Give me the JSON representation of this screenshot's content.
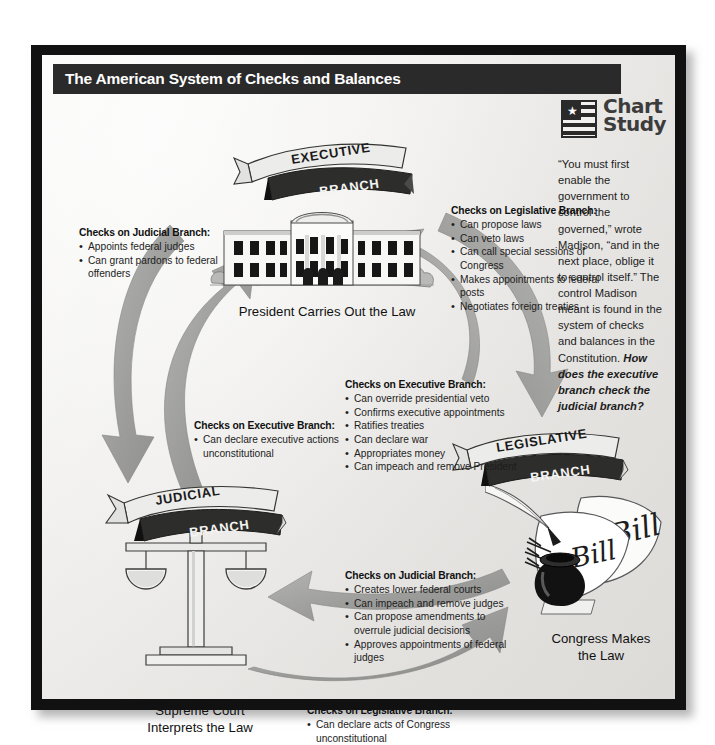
{
  "document": {
    "title": "The American System of Checks and Balances",
    "feature_logo": {
      "word_1": "Chart",
      "word_2": "Study",
      "icon": "flag-star-icon"
    }
  },
  "sidebar": {
    "quote_part_1": "“You must first enable the government to control the governed,” wrote Madison, “and in the next place, oblige it to control itself.” The control Madison meant is found in the system of checks and balances in the Constitution. ",
    "question": "How does the executive branch check the judicial branch?"
  },
  "banners": [
    {
      "name": "executive",
      "line_1": "EXECUTIVE",
      "line_2": "BRANCH"
    },
    {
      "name": "legislative",
      "line_1": "LEGISLATIVE",
      "line_2": "BRANCH"
    },
    {
      "name": "judicial",
      "line_1": "JUDICIAL",
      "line_2": "BRANCH"
    }
  ],
  "captions": {
    "president": "President Carries Out the Law",
    "supreme_court": "Supreme Court\nInterprets the Law",
    "congress": "Congress Makes\nthe Law"
  },
  "callouts": [
    {
      "id": "executive-checks-judicial",
      "heading": "Checks on Judicial Branch:",
      "items": [
        "Appoints federal judges",
        "Can grant pardons to federal offenders"
      ]
    },
    {
      "id": "executive-checks-legislative",
      "heading": "Checks on Legislative Branch:",
      "items": [
        "Can propose laws",
        "Can veto laws",
        "Can call special sessions of Congress",
        "Makes appointments to federal posts",
        "Negotiates foreign treaties"
      ]
    },
    {
      "id": "legislative-checks-executive",
      "heading": "Checks on Executive Branch:",
      "items": [
        "Can override presidential veto",
        "Confirms executive appointments",
        "Ratifies treaties",
        "Can declare war",
        "Appropriates money",
        "Can impeach and remove President"
      ]
    },
    {
      "id": "judicial-checks-executive",
      "heading": "Checks on Executive Branch:",
      "items": [
        "Can declare executive actions unconstitutional"
      ]
    },
    {
      "id": "legislative-checks-judicial",
      "heading": "Checks on Judicial Branch:",
      "items": [
        "Creates lower federal courts",
        "Can impeach and remove judges",
        "Can propose amendments to overrule judicial decisions",
        "Approves appointments of federal judges"
      ]
    },
    {
      "id": "judicial-checks-legislative",
      "heading": "Checks on Legislative Branch:",
      "items": [
        "Can declare acts of Congress unconstitutional"
      ]
    }
  ],
  "illustrations": [
    {
      "name": "white-house-illustration"
    },
    {
      "name": "scales-of-justice-illustration"
    },
    {
      "name": "bill-papers-quill-inkwell-illustration"
    }
  ],
  "colors": {
    "frame": "#111111",
    "title_bar": "#2a2a2a",
    "page": "#f2f1ef",
    "arrow_gray": "#9a9a98",
    "logo_gray": "#3c3c3c"
  }
}
